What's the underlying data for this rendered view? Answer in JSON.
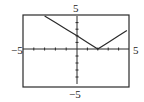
{
  "chart_data": {
    "type": "line",
    "title": "",
    "xlabel": "",
    "ylabel": "",
    "xlim": [
      -5,
      5
    ],
    "ylim": [
      -5,
      5
    ],
    "x_tick_step": 1,
    "y_tick_step": 1,
    "grid": false,
    "legend": null,
    "annotations": {
      "x_min_label": "-5",
      "x_max_label": "5",
      "y_max_label": "5",
      "y_min_label": "-5"
    },
    "series": [
      {
        "name": "y = |x - 2|",
        "x": [
          -3,
          -2,
          -1,
          0,
          1,
          2,
          3,
          4,
          4.8
        ],
        "y": [
          5,
          4,
          3,
          2,
          1,
          0,
          1,
          2,
          2.8
        ]
      }
    ]
  },
  "labels": {
    "x_min": "−5",
    "x_max": "5",
    "y_max": "5",
    "y_min": "−5"
  },
  "colors": {
    "line": "#2a2a2a",
    "frame": "#2a2a2a",
    "axis": "#2a2a2a"
  }
}
